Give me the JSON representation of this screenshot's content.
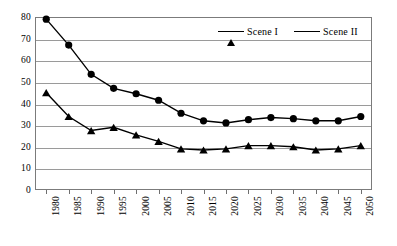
{
  "chart_data": {
    "type": "line",
    "title": "",
    "xlabel": "",
    "ylabel": "",
    "categories": [
      "1980",
      "1985",
      "1990",
      "1995",
      "2000",
      "2005",
      "2010",
      "2015",
      "2020",
      "2025",
      "2030",
      "2035",
      "2040",
      "2045",
      "2050"
    ],
    "series": [
      {
        "name": "Scene I",
        "marker": "triangle",
        "color": "#000000",
        "values": [
          45,
          34,
          27.5,
          29,
          25.5,
          22.5,
          19,
          18.5,
          19,
          20.5,
          20.5,
          20,
          18.5,
          19,
          20.5
        ]
      },
      {
        "name": "Scene II",
        "marker": "circle",
        "color": "#000000",
        "values": [
          79,
          67,
          53.5,
          47,
          44.5,
          41.5,
          35.5,
          32,
          31,
          32.5,
          33.5,
          33,
          32,
          32,
          34
        ]
      }
    ],
    "ylim": [
      0,
      80
    ],
    "yticks": [
      0,
      10,
      20,
      30,
      40,
      50,
      60,
      70,
      80
    ],
    "ytick_labels": [
      "0",
      "10",
      "20",
      "30",
      "40",
      "50",
      "60",
      "70",
      "80"
    ],
    "grid": true,
    "grid_axis": "y",
    "legend_position": "top-right-inside",
    "xtick_label_rotation": 90
  },
  "legend": {
    "entries": [
      {
        "label": "Scene I"
      },
      {
        "label": "Scene II"
      }
    ]
  }
}
